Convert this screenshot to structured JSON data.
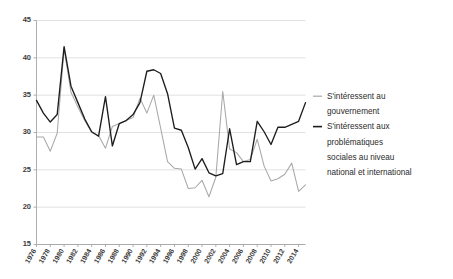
{
  "chart_data": {
    "type": "line",
    "title": "",
    "subtitle": "",
    "xlabel": "",
    "ylabel": "",
    "ylim": [
      15,
      45
    ],
    "ytick_values": [
      15,
      20,
      25,
      30,
      35,
      40,
      45
    ],
    "ytick_labels": [
      "15",
      "20",
      "25",
      "30",
      "35",
      "40",
      "45"
    ],
    "grid": true,
    "grid_axis": "y",
    "legend_position": "right",
    "x": [
      1976,
      1977,
      1978,
      1979,
      1980,
      1981,
      1982,
      1983,
      1984,
      1985,
      1986,
      1987,
      1988,
      1989,
      1990,
      1991,
      1992,
      1993,
      1994,
      1995,
      1996,
      1997,
      1998,
      1999,
      2000,
      2001,
      2002,
      2003,
      2004,
      2005,
      2006,
      2007,
      2008,
      2009,
      2010,
      2011,
      2012,
      2013,
      2014,
      2015
    ],
    "xtick_labels": [
      "1976",
      "1978",
      "1980",
      "1982",
      "1984",
      "1986",
      "1988",
      "1990",
      "1992",
      "1994",
      "1996",
      "1998",
      "2000",
      "2002",
      "2004",
      "2006",
      "2008",
      "2010",
      "2012",
      "2014"
    ],
    "xtick_values": [
      1976,
      1978,
      1980,
      1982,
      1984,
      1986,
      1988,
      1990,
      1992,
      1994,
      1996,
      1998,
      2000,
      2002,
      2004,
      2006,
      2008,
      2010,
      2012,
      2014
    ],
    "xtick_rotation": -60,
    "series": [
      {
        "name": "S'intéressent au gouvernement",
        "color": "#a8a8a8",
        "values": [
          29.4,
          29.4,
          27.5,
          29.9,
          41.2,
          35.4,
          33.4,
          31.6,
          30.0,
          29.6,
          27.9,
          30.8,
          31.2,
          31.6,
          32.0,
          34.6,
          32.6,
          35.0,
          30.6,
          26.1,
          25.2,
          25.1,
          22.5,
          22.6,
          23.6,
          21.4,
          24.0,
          35.5,
          27.8,
          27.3,
          26.1,
          26.4,
          29.1,
          25.5,
          23.5,
          23.8,
          24.4,
          25.9,
          22.1,
          23.0
        ]
      },
      {
        "name": "S'intéressent aux problématiques sociales au niveau national et international",
        "color": "#1d1d1d",
        "values": [
          34.3,
          32.6,
          31.4,
          32.4,
          41.5,
          36.2,
          34.0,
          31.8,
          30.1,
          29.5,
          34.8,
          28.2,
          31.2,
          31.6,
          32.4,
          34.0,
          38.2,
          38.4,
          37.9,
          35.2,
          30.6,
          30.3,
          28.0,
          25.1,
          26.5,
          24.6,
          24.2,
          24.5,
          30.5,
          25.7,
          26.1,
          26.1,
          31.5,
          30.1,
          28.4,
          30.7,
          30.7,
          31.1,
          31.5,
          34.0
        ]
      }
    ],
    "legend": [
      {
        "label_lines": [
          "S'intéressent au",
          "gouvernement"
        ],
        "marker": "line",
        "color": "#a8a8a8"
      },
      {
        "label_lines": [
          "S'intéressent aux",
          "problématiques",
          "sociales au niveau",
          "national et international"
        ],
        "marker": "line",
        "color": "#1d1d1d"
      }
    ]
  }
}
